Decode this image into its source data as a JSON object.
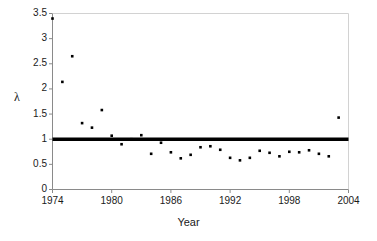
{
  "chart_data": {
    "type": "scatter",
    "title": "",
    "xlabel": "Year",
    "ylabel": "λ",
    "xlim": [
      1974,
      2004
    ],
    "ylim": [
      0,
      3.5
    ],
    "grid": false,
    "legend": "none",
    "xticks": [
      1974,
      1980,
      1986,
      1992,
      1998,
      2004
    ],
    "xtick_labels": [
      "1974",
      "1980",
      "1986",
      "1992",
      "1998",
      "2004"
    ],
    "yticks": [
      0,
      0.5,
      1,
      1.5,
      2,
      2.5,
      3,
      3.5
    ],
    "ytick_labels": [
      "0",
      "0.5",
      "1",
      "1.5",
      "2",
      "2.5",
      "3",
      "3.5"
    ],
    "marker": "square",
    "marker_color": "#000000",
    "marker_size": 2.6,
    "reference_line": {
      "name": "lambda-equals-one",
      "y": 1.0,
      "color": "#000000",
      "width": 3.4,
      "x_start": 1974,
      "x_end": 2004
    },
    "series": [
      {
        "name": "lambda",
        "x": [
          1974,
          1975,
          1976,
          1977,
          1978,
          1979,
          1980,
          1981,
          1982,
          1983,
          1984,
          1985,
          1986,
          1987,
          1988,
          1989,
          1990,
          1991,
          1992,
          1993,
          1994,
          1995,
          1996,
          1997,
          1998,
          1999,
          2000,
          2001,
          2002,
          2003
        ],
        "y": [
          3.4,
          2.14,
          2.65,
          1.32,
          1.23,
          1.58,
          1.07,
          0.9,
          1.0,
          1.08,
          0.71,
          0.93,
          0.74,
          0.62,
          0.69,
          0.84,
          0.86,
          0.79,
          0.63,
          0.58,
          0.63,
          0.77,
          0.73,
          0.66,
          0.75,
          0.74,
          0.78,
          0.71,
          0.66,
          1.43
        ]
      }
    ]
  },
  "axis_style": {
    "axis_color": "#808080",
    "tick_color": "#808080",
    "plot_border_color": "#c8c8c8"
  }
}
